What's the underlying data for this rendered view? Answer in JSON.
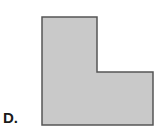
{
  "option": {
    "label": "D."
  },
  "shape": {
    "type": "L-shape",
    "fill": "#c9c9c9",
    "stroke": "#555555",
    "points": "42,17 97,17 97,72 153,72 153,125 42,125"
  }
}
